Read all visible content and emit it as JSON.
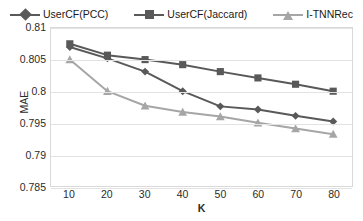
{
  "chart_data": {
    "type": "line",
    "title": "",
    "xlabel": "K",
    "ylabel": "MAE",
    "x": [
      10,
      20,
      30,
      40,
      50,
      60,
      70,
      80
    ],
    "categories": [
      "10",
      "20",
      "30",
      "40",
      "50",
      "60",
      "70",
      "80"
    ],
    "xlim": [
      5,
      85
    ],
    "ylim": [
      0.785,
      0.81
    ],
    "yticks": [
      0.81,
      0.805,
      0.8,
      0.795,
      0.79,
      0.785
    ],
    "ytick_labels": [
      "0.81",
      "0.805",
      "0.8",
      "0.795",
      "0.79",
      "0.785"
    ],
    "grid": "horizontal",
    "legend_position": "top-center",
    "series": [
      {
        "name": "UserCF(PCC)",
        "marker": "diamond",
        "color": "#595959",
        "values": [
          0.807,
          0.8052,
          0.8031,
          0.8,
          0.7976,
          0.7971,
          0.7961,
          0.7952
        ]
      },
      {
        "name": "UserCF(Jaccard)",
        "marker": "square",
        "color": "#595959",
        "values": [
          0.8075,
          0.8057,
          0.805,
          0.8042,
          0.8031,
          0.8021,
          0.8011,
          0.8
        ]
      },
      {
        "name": "I-TNNRec",
        "marker": "triangle",
        "color": "#a6a6a6",
        "values": [
          0.805,
          0.8,
          0.7977,
          0.7967,
          0.796,
          0.795,
          0.7941,
          0.7932
        ]
      }
    ]
  },
  "legend": {
    "items": [
      {
        "label": "UserCF(PCC)"
      },
      {
        "label": "UserCF(Jaccard)"
      },
      {
        "label": "I-TNNRec"
      }
    ]
  },
  "axes": {
    "y_title": "MAE",
    "x_title": "K"
  },
  "colors": {
    "series_dark": "#595959",
    "series_light": "#a6a6a6",
    "gridline": "#e3e3e3",
    "plot_border": "#d9d9d9",
    "text": "#2b2b2b",
    "background": "#ffffff"
  }
}
